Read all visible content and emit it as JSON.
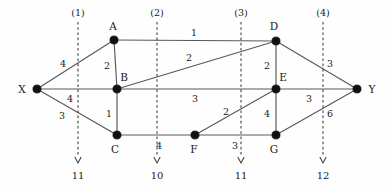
{
  "diagram": {
    "background_color": "#fefefe",
    "edge_color": "#58585a",
    "node_color": "#111111",
    "cut_color": "#3a3a3a",
    "nodes": [
      {
        "id": "X",
        "label": "X",
        "x": 37,
        "y": 89,
        "label_x": 22,
        "label_y": 89
      },
      {
        "id": "A",
        "label": "A",
        "x": 114,
        "y": 40,
        "label_x": 113,
        "label_y": 26
      },
      {
        "id": "B",
        "label": "B",
        "x": 117,
        "y": 89,
        "label_x": 124,
        "label_y": 77
      },
      {
        "id": "C",
        "label": "C",
        "x": 117,
        "y": 135,
        "label_x": 115,
        "label_y": 149
      },
      {
        "id": "D",
        "label": "D",
        "x": 276,
        "y": 41,
        "label_x": 274,
        "label_y": 26
      },
      {
        "id": "E",
        "label": "E",
        "x": 276,
        "y": 89,
        "label_x": 283,
        "label_y": 77
      },
      {
        "id": "F",
        "label": "F",
        "x": 195,
        "y": 135,
        "label_x": 194,
        "label_y": 149
      },
      {
        "id": "G",
        "label": "G",
        "x": 276,
        "y": 135,
        "label_x": 274,
        "label_y": 149
      },
      {
        "id": "Y",
        "label": "Y",
        "x": 357,
        "y": 89,
        "label_x": 372,
        "label_y": 89
      }
    ],
    "edges": [
      {
        "from": "X",
        "to": "A",
        "weight": "4",
        "label_x": 63,
        "label_y": 64
      },
      {
        "from": "X",
        "to": "B",
        "weight": "4",
        "label_x": 70,
        "label_y": 99
      },
      {
        "from": "X",
        "to": "C",
        "weight": "3",
        "label_x": 62,
        "label_y": 116
      },
      {
        "from": "A",
        "to": "B",
        "weight": "2",
        "label_x": 107,
        "label_y": 66
      },
      {
        "from": "A",
        "to": "D",
        "weight": "1",
        "label_x": 194,
        "label_y": 33
      },
      {
        "from": "B",
        "to": "D",
        "weight": "2",
        "label_x": 189,
        "label_y": 58
      },
      {
        "from": "B",
        "to": "E",
        "weight": "3",
        "label_x": 195,
        "label_y": 99
      },
      {
        "from": "B",
        "to": "C",
        "weight": "1",
        "label_x": 109,
        "label_y": 114
      },
      {
        "from": "C",
        "to": "F",
        "weight": "4",
        "label_x": 159,
        "label_y": 146
      },
      {
        "from": "F",
        "to": "E",
        "weight": "2",
        "label_x": 226,
        "label_y": 112
      },
      {
        "from": "F",
        "to": "G",
        "weight": "3",
        "label_x": 235,
        "label_y": 146
      },
      {
        "from": "D",
        "to": "E",
        "weight": "2",
        "label_x": 267,
        "label_y": 66
      },
      {
        "from": "D",
        "to": "Y",
        "weight": "3",
        "label_x": 330,
        "label_y": 64
      },
      {
        "from": "E",
        "to": "G",
        "weight": "4",
        "label_x": 267,
        "label_y": 114
      },
      {
        "from": "E",
        "to": "Y",
        "weight": "3",
        "label_x": 309,
        "label_y": 99
      },
      {
        "from": "G",
        "to": "Y",
        "weight": "6",
        "label_x": 330,
        "label_y": 114
      }
    ],
    "cuts": [
      {
        "name": "(1)",
        "value": "11",
        "x": 78,
        "top": 22,
        "bottom": 163,
        "name_y": 13,
        "value_y": 176
      },
      {
        "name": "(2)",
        "value": "10",
        "x": 157,
        "top": 22,
        "bottom": 163,
        "name_y": 13,
        "value_y": 176
      },
      {
        "name": "(3)",
        "value": "11",
        "x": 241,
        "top": 22,
        "bottom": 163,
        "name_y": 13,
        "value_y": 176
      },
      {
        "name": "(4)",
        "value": "12",
        "x": 323,
        "top": 22,
        "bottom": 163,
        "name_y": 13,
        "value_y": 176
      }
    ]
  }
}
